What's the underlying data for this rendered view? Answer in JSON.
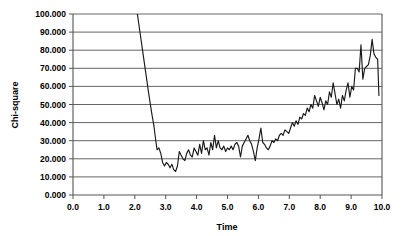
{
  "chart_data": {
    "type": "line",
    "title": "",
    "xlabel": "Time",
    "ylabel": "Chi-square",
    "xlim": [
      0.0,
      10.0
    ],
    "ylim": [
      0.0,
      100.0
    ],
    "grid": "horizontal",
    "legend": "none",
    "xticks": [
      "0.0",
      "1.0",
      "2.0",
      "3.0",
      "4.0",
      "5.0",
      "6.0",
      "7.0",
      "8.0",
      "9.0",
      "10.0"
    ],
    "xtick_values": [
      0.0,
      1.0,
      2.0,
      3.0,
      4.0,
      5.0,
      6.0,
      7.0,
      8.0,
      9.0,
      10.0
    ],
    "yticks": [
      "0.000",
      "10.000",
      "20.000",
      "30.000",
      "40.000",
      "50.000",
      "60.000",
      "70.000",
      "80.000",
      "90.000",
      "100.000"
    ],
    "ytick_values": [
      0,
      10,
      20,
      30,
      40,
      50,
      60,
      70,
      80,
      90,
      100
    ],
    "series": [
      {
        "name": "Chi-square",
        "color": "#1a1a1a",
        "clipped_above": true,
        "note": "Curve enters plot at top edge (value above 100) near t=2.0 and terminates at t=9.9",
        "x": [
          1.98,
          2.05,
          2.15,
          2.25,
          2.35,
          2.45,
          2.55,
          2.62,
          2.68,
          2.72,
          2.78,
          2.84,
          2.9,
          2.96,
          3.02,
          3.08,
          3.14,
          3.2,
          3.26,
          3.32,
          3.38,
          3.44,
          3.5,
          3.56,
          3.62,
          3.68,
          3.74,
          3.8,
          3.86,
          3.92,
          3.98,
          4.04,
          4.1,
          4.16,
          4.22,
          4.28,
          4.34,
          4.4,
          4.46,
          4.52,
          4.58,
          4.64,
          4.7,
          4.76,
          4.82,
          4.88,
          4.94,
          5.0,
          5.06,
          5.12,
          5.18,
          5.24,
          5.3,
          5.36,
          5.42,
          5.48,
          5.54,
          5.6,
          5.66,
          5.72,
          5.78,
          5.84,
          5.9,
          5.96,
          6.02,
          6.08,
          6.14,
          6.2,
          6.26,
          6.32,
          6.38,
          6.44,
          6.5,
          6.56,
          6.62,
          6.68,
          6.74,
          6.8,
          6.86,
          6.92,
          6.98,
          7.04,
          7.1,
          7.16,
          7.22,
          7.28,
          7.34,
          7.4,
          7.46,
          7.52,
          7.58,
          7.64,
          7.7,
          7.76,
          7.82,
          7.88,
          7.94,
          8.0,
          8.06,
          8.12,
          8.18,
          8.24,
          8.3,
          8.36,
          8.42,
          8.48,
          8.54,
          8.6,
          8.66,
          8.72,
          8.78,
          8.84,
          8.9,
          8.96,
          9.02,
          9.08,
          9.14,
          9.2,
          9.26,
          9.32,
          9.38,
          9.44,
          9.5,
          9.56,
          9.62,
          9.68,
          9.74,
          9.8,
          9.86,
          9.9
        ],
        "y": [
          112,
          104,
          92,
          80,
          68,
          56,
          45,
          38,
          30,
          25,
          26,
          23,
          18,
          16,
          18,
          17,
          15,
          17,
          14,
          13,
          16,
          24,
          22,
          20,
          19,
          23,
          25,
          22,
          21,
          26,
          24,
          22,
          28,
          23,
          30,
          25,
          26,
          22,
          29,
          25,
          33,
          26,
          30,
          26,
          25,
          27,
          24,
          26,
          25,
          27,
          25,
          28,
          29,
          27,
          21,
          27,
          29,
          31,
          33,
          30,
          28,
          24,
          19,
          26,
          31,
          37,
          29,
          28,
          26,
          25,
          27,
          30,
          29,
          31,
          30,
          33,
          34,
          33,
          36,
          35,
          34,
          37,
          40,
          38,
          41,
          39,
          43,
          42,
          45,
          44,
          48,
          46,
          50,
          48,
          55,
          52,
          49,
          54,
          51,
          47,
          52,
          50,
          57,
          54,
          62,
          56,
          50,
          53,
          48,
          55,
          52,
          58,
          62,
          54,
          60,
          58,
          70,
          70,
          68,
          83,
          64,
          70,
          71,
          72,
          77,
          86,
          78,
          76,
          75,
          55
        ]
      }
    ]
  },
  "axes": {
    "y_axis_title": "Chi-square",
    "x_axis_title": "Time"
  }
}
